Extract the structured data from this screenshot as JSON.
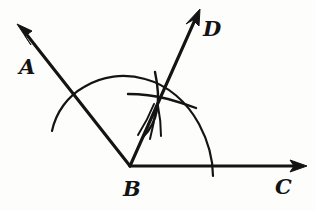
{
  "figure": {
    "background_color": "#fdfdfc",
    "ink_color": "#141414"
  },
  "labels": {
    "a": "A",
    "b": "B",
    "c": "C",
    "d": "D"
  },
  "geometry": {
    "vertex": {
      "name": "B",
      "x": 130,
      "y": 166
    },
    "rays": [
      {
        "name": "ray-BA",
        "from_x": 130,
        "from_y": 166,
        "to_x": 20,
        "to_y": 27,
        "arrow": true
      },
      {
        "name": "ray-BD",
        "from_x": 130,
        "from_y": 166,
        "to_x": 199,
        "to_y": 11,
        "arrow": true
      },
      {
        "name": "ray-BC",
        "from_x": 130,
        "from_y": 166,
        "to_x": 305,
        "to_y": 166,
        "arrow": true
      }
    ],
    "arcs": [
      {
        "name": "main-compass-arc",
        "center_x": 130,
        "center_y": 166,
        "radius": 85
      },
      {
        "name": "intersection-arc-left",
        "note": "small arc crossing near bisector"
      },
      {
        "name": "intersection-arc-right",
        "note": "small arc crossing near bisector"
      }
    ]
  }
}
